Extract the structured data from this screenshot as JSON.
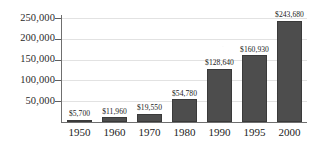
{
  "chart_data": {
    "type": "bar",
    "title": "",
    "subtitle": "",
    "xlabel": "",
    "ylabel": "",
    "categories": [
      "1950",
      "1960",
      "1970",
      "1980",
      "1990",
      "1995",
      "2000"
    ],
    "values": [
      5700,
      11960,
      19550,
      54780,
      128640,
      160930,
      243680
    ],
    "value_labels": [
      "$5,700",
      "$11,960",
      "$19,550",
      "$54,780",
      "$128,640",
      "$160,930",
      "$243,680"
    ],
    "ylim": [
      0,
      250000
    ],
    "ytick_values": [
      50000,
      100000,
      150000,
      200000,
      250000
    ],
    "ytick_labels": [
      "50,000",
      "100,000",
      "150,000",
      "200,000",
      "250,000"
    ],
    "grid": true,
    "grid_axis": "y",
    "legend": false,
    "legend_position": "none",
    "bar_color": "#4d4d4d",
    "gridline_color": "#e2e2e2",
    "axis_color": "#6f6f6f",
    "text_color": "#222222"
  }
}
